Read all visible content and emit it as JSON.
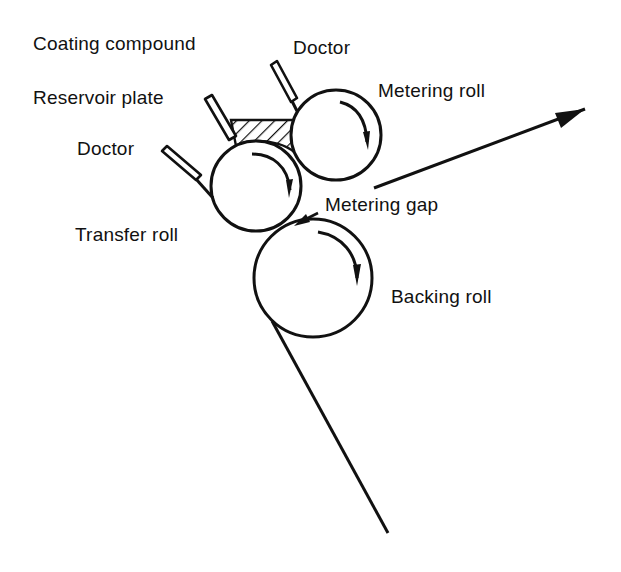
{
  "diagram": {
    "colors": {
      "stroke": "#111111",
      "background": "#ffffff"
    },
    "labels": {
      "coating_compound": "Coating compound",
      "doctor_top": "Doctor",
      "metering_roll": "Metering roll",
      "reservoir_plate": "Reservoir plate",
      "doctor_left": "Doctor",
      "metering_gap": "Metering gap",
      "transfer_roll": "Transfer roll",
      "backing_roll": "Backing roll"
    },
    "components": [
      {
        "name": "metering-roll",
        "shape": "circle",
        "cx": 336,
        "cy": 135,
        "r": 45
      },
      {
        "name": "transfer-roll",
        "shape": "circle",
        "cx": 256,
        "cy": 186,
        "r": 45
      },
      {
        "name": "backing-roll",
        "shape": "circle",
        "cx": 313,
        "cy": 278,
        "r": 59
      },
      {
        "name": "reservoir-plate",
        "shape": "blade"
      },
      {
        "name": "doctor-top",
        "shape": "blade"
      },
      {
        "name": "doctor-left",
        "shape": "blade"
      },
      {
        "name": "coating-compound-pool",
        "shape": "hatched-region"
      },
      {
        "name": "web-path",
        "shape": "line-with-arrow"
      }
    ]
  }
}
